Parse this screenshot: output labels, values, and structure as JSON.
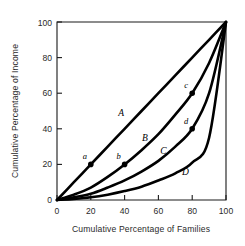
{
  "chart_data": {
    "type": "line",
    "title": "",
    "xlabel": "Cumulative Percentage of Families",
    "ylabel": "Cumulative Percentage of Income",
    "xlim": [
      0,
      100
    ],
    "ylim": [
      0,
      100
    ],
    "xticks": [
      0,
      20,
      40,
      60,
      80,
      100
    ],
    "yticks": [
      0,
      20,
      40,
      60,
      80,
      100
    ],
    "grid": false,
    "legend": "none",
    "series": [
      {
        "name": "A",
        "label": "A",
        "x": [
          0,
          10,
          20,
          30,
          40,
          50,
          60,
          70,
          80,
          90,
          100
        ],
        "values": [
          0,
          10,
          20,
          30,
          40,
          50,
          60,
          70,
          80,
          90,
          100
        ]
      },
      {
        "name": "B",
        "label": "B",
        "x": [
          0,
          10,
          20,
          30,
          40,
          50,
          60,
          70,
          80,
          90,
          100
        ],
        "values": [
          0,
          3,
          7,
          13,
          20,
          28,
          37,
          48,
          60,
          77,
          100
        ]
      },
      {
        "name": "C",
        "label": "C",
        "x": [
          0,
          10,
          20,
          30,
          40,
          50,
          60,
          70,
          80,
          90,
          100
        ],
        "values": [
          0,
          1.5,
          3.5,
          7,
          11,
          16,
          22,
          30,
          40,
          60,
          100
        ]
      },
      {
        "name": "D",
        "label": "D",
        "x": [
          0,
          10,
          20,
          30,
          40,
          50,
          60,
          70,
          80,
          90,
          100
        ],
        "values": [
          0,
          0.6,
          1.5,
          3,
          5,
          7.5,
          11,
          15,
          21,
          35,
          100
        ]
      }
    ],
    "annotations": [
      {
        "label": "a",
        "x": 20,
        "y": 20,
        "on_series": "A"
      },
      {
        "label": "b",
        "x": 40,
        "y": 20,
        "on_series": "B"
      },
      {
        "label": "c",
        "x": 80,
        "y": 60,
        "on_series": "B"
      },
      {
        "label": "d",
        "x": 80,
        "y": 40,
        "on_series": "C"
      }
    ],
    "curve_label_positions": [
      {
        "label": "A",
        "x": 38,
        "y": 47
      },
      {
        "label": "B",
        "x": 52,
        "y": 33
      },
      {
        "label": "C",
        "x": 63,
        "y": 26
      },
      {
        "label": "D",
        "x": 76,
        "y": 14
      }
    ]
  },
  "colors": {
    "curve": "#000000",
    "axis": "#1a1a1a",
    "text": "#2a2a2a",
    "background": "#ffffff"
  }
}
